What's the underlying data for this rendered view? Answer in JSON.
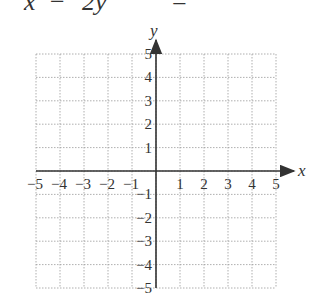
{
  "equation_fragment": {
    "parts": [
      "x",
      "−",
      "2y",
      "="
    ],
    "note_visible": "clipped top edge"
  },
  "graph": {
    "x_axis_label": "x",
    "y_axis_label": "y",
    "x_range": [
      -5,
      5
    ],
    "y_range": [
      -5,
      5
    ],
    "grid": "dotted",
    "x_ticks": [
      "−5",
      "−4",
      "−3",
      "−2",
      "−1",
      "1",
      "2",
      "3",
      "4",
      "5"
    ],
    "y_ticks": [
      "5",
      "4",
      "3",
      "2",
      "1",
      "−1",
      "−2",
      "−3",
      "−4",
      "−5"
    ],
    "colors": {
      "axis": "#333333",
      "grid": "#9a9a9a",
      "text": "#333333"
    }
  }
}
